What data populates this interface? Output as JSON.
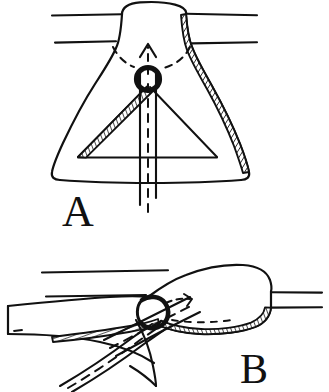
{
  "figure": {
    "type": "line-drawing",
    "background_color": "#ffffff",
    "ink_color": "#111111",
    "width": 329,
    "height": 392,
    "panel_count": 2
  },
  "panels": [
    {
      "id": "A",
      "label": "A",
      "label_x": 62,
      "label_y": 225,
      "view": "frontal",
      "description": "Bell-shaped structure seen end-on, suspended between two horizontal tissue planes, with a circular ring at its center through which a vertical shaft passes; a dashed arrow points upward through the ring.",
      "elements": {
        "horizontal_lines": [
          {
            "name": "upper-tissue-line-left",
            "x1": 52,
            "y1": 15,
            "x2": 122,
            "y2": 14
          },
          {
            "name": "upper-tissue-line-right",
            "x1": 186,
            "y1": 14,
            "x2": 256,
            "y2": 15
          },
          {
            "name": "lower-tissue-line-left",
            "x1": 55,
            "y1": 42,
            "x2": 116,
            "y2": 41
          },
          {
            "name": "lower-tissue-line-right",
            "x1": 192,
            "y1": 43,
            "x2": 256,
            "y2": 42
          }
        ],
        "ring": {
          "name": "central-ring",
          "cx": 148,
          "cy": 79,
          "r": 11,
          "stroke_width": 5
        },
        "shaft": {
          "name": "vertical-shaft",
          "x": 148,
          "top": 72,
          "bottom": 205,
          "half_width": 8
        },
        "center_dashes": {
          "name": "shaft-center-line",
          "x": 148,
          "top": 84,
          "bottom": 215
        },
        "arrow": {
          "name": "upward-dashed-arrow",
          "x": 148,
          "tail_y": 74,
          "head_y": 40
        },
        "hatched_bands": [
          {
            "name": "right-hatched-margin"
          },
          {
            "name": "left-hatched-margin"
          }
        ],
        "trestle": {
          "name": "inner-triangle",
          "apex_x": 148,
          "apex_y": 86,
          "left_x": 78,
          "right_x": 216,
          "base_y": 158
        }
      }
    },
    {
      "id": "B",
      "label": "B",
      "label_x": 240,
      "label_y": 382,
      "view": "lateral",
      "description": "Same structure seen from the side; an elongated lobed body lies between two horizontal tissue planes, with the ring at its left end and a pair of long instrument jaws (dashed center lines) approaching from the lower left; the inferior margin is hatched.",
      "elements": {
        "horizontal_lines": [
          {
            "name": "upper-tissue-line",
            "x1": 42,
            "y1": 272,
            "x2": 170,
            "y2": 270
          },
          {
            "name": "lower-tissue-line",
            "x1": 46,
            "y1": 296,
            "x2": 145,
            "y2": 295
          },
          {
            "name": "upper-tissue-line-right",
            "x1": 272,
            "y1": 292,
            "x2": 320,
            "y2": 292
          },
          {
            "name": "lower-tissue-line-right",
            "x1": 272,
            "y1": 307,
            "x2": 320,
            "y2": 307
          }
        ],
        "ring": {
          "name": "lateral-ring",
          "cx": 155,
          "cy": 313,
          "r": 14,
          "stroke_width": 4
        },
        "arrow": {
          "name": "curved-dashed-arrow"
        },
        "hatched_bands": [
          {
            "name": "inferior-hatched-margin"
          },
          {
            "name": "left-hatched-margin"
          }
        ],
        "instrument": {
          "name": "instrument-jaws",
          "jaw_count": 2,
          "has_dashed_center_lines": true
        }
      }
    }
  ],
  "labels": {
    "panel_a": "A",
    "panel_b": "B"
  }
}
